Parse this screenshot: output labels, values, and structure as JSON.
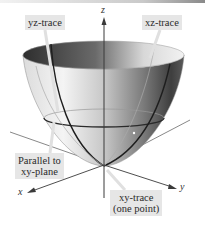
{
  "figure": {
    "axes": {
      "z": "z",
      "x": "x",
      "y": "y"
    },
    "labels": {
      "yz_trace": "yz-trace",
      "xz_trace": "xz-trace",
      "parallel_line1": "Parallel to",
      "parallel_line2": "xy-plane",
      "xy_trace_line1": "xy-trace",
      "xy_trace_line2": "(one point)"
    },
    "colors": {
      "label_box_bg": "#e6e6e6",
      "surface_dark": "#3c3c3c",
      "surface_light": "#f0f0f0",
      "trace_line": "#1e1e1e",
      "axis": "#4a4a4a"
    }
  }
}
